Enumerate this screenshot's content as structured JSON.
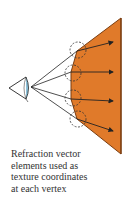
{
  "colors": {
    "surface_fill": "#e07a2a",
    "surface_edge": "#7a3d10",
    "lines": "#222222",
    "eye_iris": "#8fc4dc",
    "dashed_circles": "#333333"
  },
  "icons": {
    "viewer": "eye-icon"
  },
  "caption": {
    "lines": [
      "Refraction vector",
      "elements used as",
      "texture coordinates",
      "at each vertex"
    ]
  }
}
